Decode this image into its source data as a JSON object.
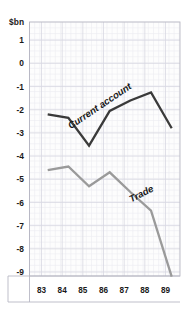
{
  "chart_data": {
    "type": "line",
    "title": "",
    "subtitle": "",
    "xlabel": "",
    "ylabel": "$bn",
    "unit_label": "$bn",
    "xlim": [
      82.75,
      89.75
    ],
    "ylim": [
      -9.5,
      1.5
    ],
    "grid": true,
    "grid_minor": true,
    "legend_position": "inline-annotation",
    "x_tick_labels": [
      "83",
      "84",
      "85",
      "86",
      "87",
      "88",
      "89"
    ],
    "x_tick_values": [
      83,
      84,
      85,
      86,
      87,
      88,
      89
    ],
    "y_tick_labels": [
      "1",
      "0",
      "-1",
      "-2",
      "-3",
      "-4",
      "-5",
      "-6",
      "-7",
      "-8",
      "-9"
    ],
    "y_tick_values": [
      1,
      0,
      -1,
      -2,
      -3,
      -4,
      -5,
      -6,
      -7,
      -8,
      -9
    ],
    "x": [
      83.3,
      84.3,
      85.3,
      86.3,
      87.3,
      88.3,
      89.3
    ],
    "series": [
      {
        "name": "Current account",
        "label": "Current account",
        "color": "#3a3a3a",
        "values": [
          -2.2,
          -2.35,
          -3.55,
          -2.05,
          -1.6,
          -1.25,
          -2.8
        ]
      },
      {
        "name": "Trade",
        "label": "Trade",
        "color": "#9a9a9a",
        "values": [
          -4.6,
          -4.45,
          -5.3,
          -4.7,
          -5.55,
          -6.35,
          -9.2
        ]
      }
    ],
    "annotations": [
      {
        "text": "Current account",
        "series": "Current account",
        "x": 85.9,
        "y": -1.95,
        "rotation": -34
      },
      {
        "text": "Trade",
        "series": "Trade",
        "x": 87.9,
        "y": -5.75,
        "rotation": -27
      }
    ],
    "colors": {
      "background": "#ffffff",
      "plot_background": "#fdfdfd",
      "grid_minor": "#ececf2",
      "grid_major": "#d8d8e2",
      "axis": "#b8b8c4",
      "text": "#1a1a1a",
      "current_account_line": "#3a3a3a",
      "trade_line": "#9a9a9a"
    }
  }
}
